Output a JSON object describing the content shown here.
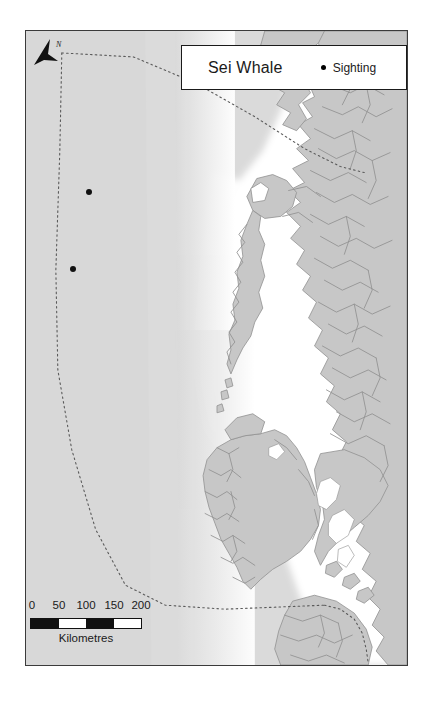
{
  "figure": {
    "kind": "thematic-distribution-map",
    "region": "British Columbia coast"
  },
  "legend": {
    "title": "Sei Whale",
    "entries": [
      {
        "label": "Sighting",
        "symbol": "dot",
        "color": "#000000"
      }
    ]
  },
  "north_arrow": {
    "label": "N"
  },
  "scale": {
    "ticks": [
      "0",
      "50",
      "100",
      "150",
      "200"
    ],
    "units": "Kilometres",
    "segments": [
      "fill",
      "empty",
      "fill",
      "empty"
    ]
  },
  "sightings": [
    {
      "id": "sighting-1",
      "x": 63,
      "y": 161
    },
    {
      "id": "sighting-2",
      "x": 47,
      "y": 238
    }
  ],
  "colors": {
    "ocean": "#d9d9d9",
    "shelf": "#ffffff",
    "land": "#c6c6c6",
    "coastline": "#8d8d8d",
    "frame": "#3b3b3b",
    "boundary": "#555555",
    "sighting": "#000000"
  },
  "map_layers": [
    {
      "name": "ocean-basemap"
    },
    {
      "name": "continental-shelf"
    },
    {
      "name": "landmass"
    },
    {
      "name": "coastline"
    },
    {
      "name": "study-area-boundary"
    },
    {
      "name": "sighting-points"
    }
  ]
}
